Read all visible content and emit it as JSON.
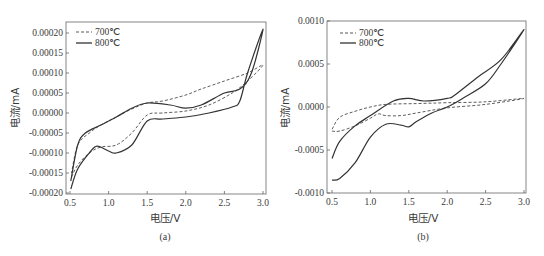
{
  "chart_data": [
    {
      "type": "line",
      "panel": "(a)",
      "title": "",
      "xlabel": "电压/V",
      "ylabel": "电流/mA",
      "xlim": [
        0.5,
        3.0
      ],
      "ylim": [
        -0.0002,
        0.0002
      ],
      "xticks": [
        "0.5",
        "1.0",
        "1.5",
        "2.0",
        "2.5",
        "3.0"
      ],
      "yticks": [
        "0.00020",
        "0.00015",
        "0.00010",
        "0.00005",
        "0.00000",
        "-0.00005",
        "-0.00010",
        "-0.00015",
        "-0.00020"
      ],
      "grid": false,
      "legend_position": "upper left",
      "series": [
        {
          "name": "700℃",
          "style": "dashed",
          "x": [
            0.52,
            0.6,
            0.75,
            0.9,
            1.1,
            1.3,
            1.5,
            1.7,
            2.0,
            2.3,
            2.6,
            2.8,
            3.0,
            2.8,
            2.5,
            2.2,
            2.0,
            1.7,
            1.5,
            1.3,
            1.1,
            0.9,
            0.75,
            0.6,
            0.52
          ],
          "y": [
            -0.00016,
            -0.00013,
            -0.0001,
            -8.5e-05,
            -8e-05,
            -5e-05,
            -5e-06,
            0.0,
            5e-06,
            2e-05,
            5e-05,
            8e-05,
            0.00012,
            0.0001,
            8e-05,
            6e-05,
            4.5e-05,
            3e-05,
            2.5e-05,
            1e-05,
            -1e-05,
            -3e-05,
            -5e-05,
            -8e-05,
            -0.00015
          ]
        },
        {
          "name": "800℃",
          "style": "solid",
          "x": [
            0.51,
            0.6,
            0.75,
            0.85,
            1.0,
            1.1,
            1.3,
            1.5,
            1.7,
            2.0,
            2.3,
            2.6,
            2.7,
            2.8,
            3.0,
            2.85,
            2.7,
            2.5,
            2.2,
            2.0,
            1.8,
            1.5,
            1.3,
            1.1,
            0.9,
            0.7,
            0.6,
            0.51
          ],
          "y": [
            -0.00019,
            -0.00014,
            -0.0001,
            -8.3e-05,
            -9.5e-05,
            -0.0001,
            -8e-05,
            -2e-05,
            -1.5e-05,
            -1e-05,
            0.0,
            1.5e-05,
            3e-05,
            0.0001,
            0.00021,
            0.0001,
            6e-05,
            5e-05,
            2e-05,
            1.2e-05,
            2e-05,
            2.5e-05,
            1.2e-05,
            -1e-05,
            -3e-05,
            -5e-05,
            -8e-05,
            -0.00017
          ]
        }
      ]
    },
    {
      "type": "line",
      "panel": "(b)",
      "title": "",
      "xlabel": "电压/V",
      "ylabel": "电流/mA",
      "xlim": [
        0.5,
        3.0
      ],
      "ylim": [
        -0.001,
        0.001
      ],
      "xticks": [
        "0.5",
        "1.0",
        "1.5",
        "2.0",
        "2.5",
        "3.0"
      ],
      "yticks": [
        "0.0010",
        "0.0005",
        "0.0000",
        "-0.0005",
        "-0.0010"
      ],
      "grid": false,
      "legend_position": "upper left",
      "series": [
        {
          "name": "700℃",
          "style": "dashed",
          "x": [
            0.5,
            0.6,
            0.8,
            1.0,
            1.1,
            1.2,
            1.4,
            1.6,
            2.0,
            2.5,
            3.0,
            2.5,
            2.0,
            1.6,
            1.2,
            1.0,
            0.8,
            0.6,
            0.5
          ],
          "y": [
            -0.00028,
            -0.00028,
            -0.00022,
            -0.00013,
            -8e-05,
            -0.0001,
            -0.0001,
            -7e-05,
            -1e-05,
            3e-05,
            0.0001,
            6e-05,
            5e-05,
            4e-05,
            3e-05,
            0.0,
            -5e-05,
            -0.00012,
            -0.00026
          ]
        },
        {
          "name": "800℃",
          "style": "solid",
          "x": [
            0.5,
            0.6,
            0.8,
            1.0,
            1.2,
            1.4,
            1.5,
            1.6,
            1.8,
            2.0,
            2.2,
            2.5,
            2.7,
            3.0,
            2.7,
            2.4,
            2.1,
            2.0,
            1.7,
            1.5,
            1.3,
            1.0,
            0.8,
            0.6,
            0.5
          ],
          "y": [
            -0.00085,
            -0.00083,
            -0.00065,
            -0.00035,
            -0.0002,
            -0.00021,
            -0.00023,
            -0.00017,
            -7e-05,
            0.0,
            0.0001,
            0.00027,
            0.0005,
            0.0009,
            0.00055,
            0.00035,
            0.00014,
            0.0001,
            7e-05,
            0.0001,
            7e-05,
            -0.0001,
            -0.00022,
            -0.0004,
            -0.0006
          ]
        }
      ]
    }
  ],
  "panels": {
    "a": {
      "label": "(a)",
      "xlabel": "电压/V",
      "ylabel": "电流/mA",
      "legend": [
        "700℃",
        "800℃"
      ],
      "xticks": [
        "0.5",
        "1.0",
        "1.5",
        "2.0",
        "2.5",
        "3.0"
      ],
      "yticks": [
        "0.00020",
        "0.00015",
        "0.00010",
        "0.00005",
        "0.00000",
        "-0.00005",
        "-0.00010",
        "-0.00015",
        "-0.00020"
      ]
    },
    "b": {
      "label": "(b)",
      "xlabel": "电压/V",
      "ylabel": "电流/mA",
      "legend": [
        "700℃",
        "800℃"
      ],
      "xticks": [
        "0.5",
        "1.0",
        "1.5",
        "2.0",
        "2.5",
        "3.0"
      ],
      "yticks": [
        "0.0010",
        "0.0005",
        "0.0000",
        "-0.0005",
        "-0.0010"
      ]
    }
  },
  "colors": {
    "line": "#333333",
    "axis": "#555555",
    "background": "#ffffff"
  }
}
